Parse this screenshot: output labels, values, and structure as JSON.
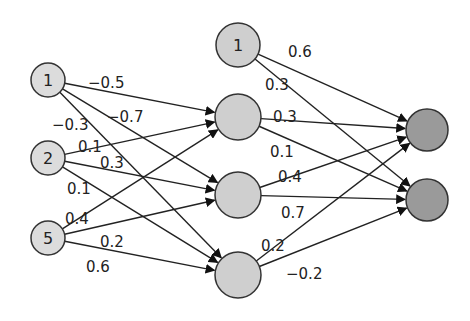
{
  "colors": {
    "input": "#dcdcdc",
    "hidden": "#cfcfcf",
    "output": "#9a9a9a",
    "stroke": "#333333"
  },
  "nodes": {
    "input": [
      {
        "id": "i1",
        "label": "1",
        "x": 48,
        "y": 80,
        "r": 17
      },
      {
        "id": "i2",
        "label": "2",
        "x": 48,
        "y": 158,
        "r": 17
      },
      {
        "id": "i3",
        "label": "5",
        "x": 48,
        "y": 238,
        "r": 17
      }
    ],
    "hidden": [
      {
        "id": "hb",
        "label": "1",
        "x": 238,
        "y": 45,
        "r": 22
      },
      {
        "id": "h1",
        "label": "",
        "x": 238,
        "y": 117,
        "r": 23
      },
      {
        "id": "h2",
        "label": "",
        "x": 238,
        "y": 195,
        "r": 23
      },
      {
        "id": "h3",
        "label": "",
        "x": 238,
        "y": 275,
        "r": 23
      }
    ],
    "output": [
      {
        "id": "o1",
        "label": "",
        "x": 427,
        "y": 130,
        "r": 21
      },
      {
        "id": "o2",
        "label": "",
        "x": 427,
        "y": 200,
        "r": 21
      }
    ]
  },
  "edges": [
    {
      "from": "i1",
      "to": "h1",
      "weight": "−0.5",
      "lx": 88,
      "ly": 88
    },
    {
      "from": "i1",
      "to": "h2",
      "weight": "−0.7",
      "lx": 107,
      "ly": 122
    },
    {
      "from": "i1",
      "to": "h3",
      "weight": "−0.3",
      "lx": 52,
      "ly": 130
    },
    {
      "from": "i2",
      "to": "h1",
      "weight": "0.1",
      "lx": 78,
      "ly": 152
    },
    {
      "from": "i2",
      "to": "h2",
      "weight": "0.3",
      "lx": 100,
      "ly": 168
    },
    {
      "from": "i2",
      "to": "h3",
      "weight": "0.1",
      "lx": 67,
      "ly": 194
    },
    {
      "from": "i3",
      "to": "h1",
      "weight": "0.4",
      "lx": 65,
      "ly": 224
    },
    {
      "from": "i3",
      "to": "h2",
      "weight": "0.2",
      "lx": 100,
      "ly": 247
    },
    {
      "from": "i3",
      "to": "h3",
      "weight": "0.6",
      "lx": 86,
      "ly": 272
    },
    {
      "from": "hb",
      "to": "o1",
      "weight": "0.6",
      "lx": 288,
      "ly": 57
    },
    {
      "from": "hb",
      "to": "o2",
      "weight": "0.3",
      "lx": 265,
      "ly": 90
    },
    {
      "from": "h1",
      "to": "o1",
      "weight": "0.3",
      "lx": 273,
      "ly": 122
    },
    {
      "from": "h1",
      "to": "o2",
      "weight": "0.1",
      "lx": 270,
      "ly": 157
    },
    {
      "from": "h2",
      "to": "o1",
      "weight": "0.4",
      "lx": 278,
      "ly": 182
    },
    {
      "from": "h2",
      "to": "o2",
      "weight": "0.7",
      "lx": 281,
      "ly": 218
    },
    {
      "from": "h3",
      "to": "o1",
      "weight": "0.2",
      "lx": 261,
      "ly": 251
    },
    {
      "from": "h3",
      "to": "o2",
      "weight": "−0.2",
      "lx": 286,
      "ly": 279
    }
  ]
}
